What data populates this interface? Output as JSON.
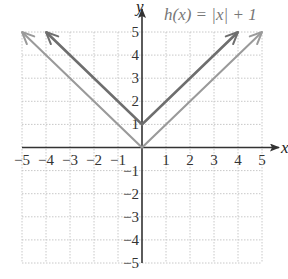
{
  "chart_data": {
    "type": "line",
    "title": "h(x) = |x| + 1",
    "xlabel": "x",
    "ylabel": "y",
    "xlim": [
      -5,
      5
    ],
    "ylim": [
      -5,
      5
    ],
    "grid": true,
    "x_ticks": [
      -5,
      -4,
      -3,
      -2,
      -1,
      1,
      2,
      3,
      4,
      5
    ],
    "y_ticks": [
      -5,
      -4,
      -3,
      -2,
      -1,
      1,
      2,
      3,
      4,
      5
    ],
    "x_tick_labels": [
      "−5",
      "−4",
      "−3",
      "−2",
      "−1",
      "1",
      "2",
      "3",
      "4",
      "5"
    ],
    "y_tick_labels": [
      "−5",
      "−4",
      "−3",
      "−2",
      "−1",
      "1",
      "2",
      "3",
      "4",
      "5"
    ],
    "series": [
      {
        "name": "h(x) = |x| + 1",
        "color": "#6e6e6e",
        "x": [
          -4,
          0,
          4
        ],
        "y": [
          5,
          1,
          5
        ],
        "arrows": true
      },
      {
        "name": "f(x) = |x|",
        "color": "#9a9a9a",
        "x": [
          -5,
          0,
          5
        ],
        "y": [
          5,
          0,
          5
        ],
        "arrows": true
      }
    ],
    "annotation": {
      "text": "h(x) = |x| + 1",
      "x": 0.6,
      "y": 5.9
    }
  },
  "colors": {
    "axis": "#333333",
    "grid": "#c8c8c8",
    "h_line": "#6e6e6e",
    "f_line": "#9a9a9a"
  }
}
